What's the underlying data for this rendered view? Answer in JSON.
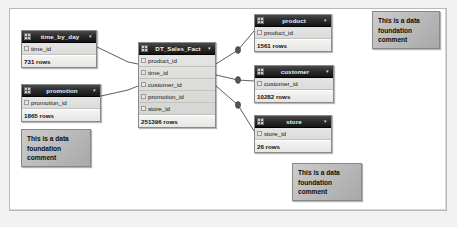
{
  "diagram": {
    "caret_glyph": "▾",
    "tables": [
      {
        "name": "time_by_day",
        "icon": "table-grid-icon",
        "fields": [
          "time_id"
        ],
        "row_count": "731 rows",
        "x": 21,
        "y": 30,
        "width": 76
      },
      {
        "name": "promotion",
        "icon": "table-grid-icon",
        "fields": [
          "promotion_id"
        ],
        "row_count": "1865 rows",
        "x": 21,
        "y": 84,
        "width": 80
      },
      {
        "name": "DT_Sales_Fact",
        "icon": "table-grid-icon",
        "fields": [
          "product_id",
          "time_id",
          "customer_id",
          "promotion_id",
          "store_id"
        ],
        "row_count": "251396 rows",
        "x": 138,
        "y": 42,
        "width": 78
      },
      {
        "name": "product",
        "icon": "table-grid-icon",
        "fields": [
          "product_id"
        ],
        "row_count": "1561 rows",
        "x": 254,
        "y": 14,
        "width": 78
      },
      {
        "name": "customer",
        "icon": "table-grid-icon",
        "fields": [
          "customer_id"
        ],
        "row_count": "10282 rows",
        "x": 254,
        "y": 65,
        "width": 80
      },
      {
        "name": "store",
        "icon": "table-grid-icon",
        "fields": [
          "store_id"
        ],
        "row_count": "26 rows",
        "x": 254,
        "y": 115,
        "width": 78
      }
    ],
    "comments": [
      {
        "text": "This is a data\nfoundation\ncomment",
        "x": 372,
        "y": 11,
        "width": 68,
        "height": 38
      },
      {
        "text": "This is a data\nfoundation\ncomment",
        "x": 21,
        "y": 129,
        "width": 70,
        "height": 38
      },
      {
        "text": "This is a data\nfoundation\ncomment",
        "x": 292,
        "y": 163,
        "width": 70,
        "height": 38
      }
    ],
    "joins": [
      {
        "from": "time_by_day",
        "to": "DT_Sales_Fact",
        "from_field": "time_id",
        "to_field": "time_id"
      },
      {
        "from": "promotion",
        "to": "DT_Sales_Fact",
        "from_field": "promotion_id",
        "to_field": "promotion_id"
      },
      {
        "from": "DT_Sales_Fact",
        "to": "product",
        "from_field": "product_id",
        "to_field": "product_id"
      },
      {
        "from": "DT_Sales_Fact",
        "to": "customer",
        "from_field": "customer_id",
        "to_field": "customer_id"
      },
      {
        "from": "DT_Sales_Fact",
        "to": "store",
        "from_field": "store_id",
        "to_field": "store_id"
      }
    ],
    "colors": {
      "canvas_background": "#f2f2f0",
      "frame_background": "#ffffff",
      "header_dark": "#1b1b1b",
      "node_body": "#d9d9d7",
      "comment_fill": "#bdbdbd",
      "link_line": "#333333"
    }
  }
}
